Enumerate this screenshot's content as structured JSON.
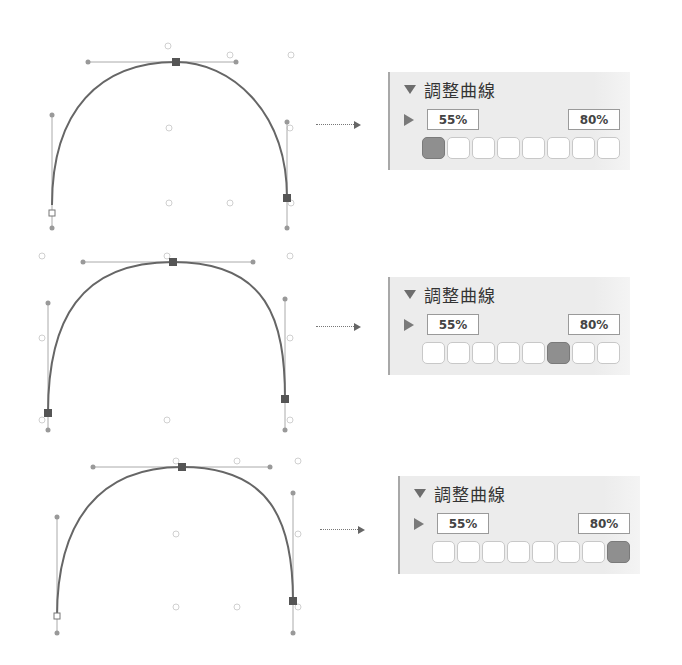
{
  "rows": [
    {
      "panel": {
        "title": "調整曲線",
        "min_value": "55%",
        "max_value": "80%",
        "selected_swatch": 0,
        "swatch_count": 8
      },
      "curve": {
        "path": "M52,205 C52,110 100,62 176,62 C230,62 287,110 287,198",
        "anchors": [
          [
            176,
            62
          ],
          [
            287,
            198
          ]
        ],
        "open_anchor": [
          52,
          213
        ],
        "handles": [
          [
            [
              88,
              62
            ],
            [
              236,
              62
            ]
          ],
          [
            [
              52,
              115
            ],
            [
              52,
              228
            ]
          ],
          [
            [
              287,
              122
            ],
            [
              287,
              228
            ]
          ]
        ],
        "guides": [
          [
            168,
            46
          ],
          [
            230,
            55
          ],
          [
            291,
            55
          ],
          [
            169,
            128
          ],
          [
            290,
            128
          ],
          [
            169,
            203
          ],
          [
            230,
            203
          ],
          [
            291,
            203
          ]
        ]
      }
    },
    {
      "panel": {
        "title": "調整曲線",
        "min_value": "55%",
        "max_value": "80%",
        "selected_swatch": 5,
        "swatch_count": 8
      },
      "curve": {
        "path": "M48,413 C48,320 80,262 173,262 C268,262 285,320 285,399",
        "anchors": [
          [
            173,
            262
          ],
          [
            285,
            399
          ],
          [
            48,
            413
          ]
        ],
        "open_anchor": null,
        "handles": [
          [
            [
              83,
              262
            ],
            [
              253,
              262
            ]
          ],
          [
            [
              48,
              303
            ],
            [
              48,
              430
            ]
          ],
          [
            [
              285,
              299
            ],
            [
              285,
              430
            ]
          ]
        ],
        "guides": [
          [
            42,
            256
          ],
          [
            167,
            256
          ],
          [
            290,
            256
          ],
          [
            42,
            338
          ],
          [
            290,
            338
          ],
          [
            42,
            420
          ],
          [
            167,
            420
          ],
          [
            290,
            420
          ]
        ]
      }
    },
    {
      "panel": {
        "title": "調整曲線",
        "min_value": "55%",
        "max_value": "80%",
        "selected_swatch": 7,
        "swatch_count": 8
      },
      "curve": {
        "path": "M57,617 C57,520 100,467 182,467 C270,467 293,520 293,601",
        "anchors": [
          [
            182,
            467
          ],
          [
            293,
            601
          ]
        ],
        "open_anchor": [
          57,
          616
        ],
        "handles": [
          [
            [
              93,
              467
            ],
            [
              270,
              467
            ]
          ],
          [
            [
              57,
              517
            ],
            [
              57,
              633
            ]
          ],
          [
            [
              293,
              493
            ],
            [
              293,
              633
            ]
          ]
        ],
        "guides": [
          [
            176,
            461
          ],
          [
            237,
            461
          ],
          [
            298,
            461
          ],
          [
            176,
            534
          ],
          [
            298,
            534
          ],
          [
            176,
            607
          ],
          [
            237,
            607
          ],
          [
            298,
            607
          ]
        ]
      }
    }
  ],
  "arrow_label": "",
  "colors": {
    "curve": "#666666",
    "handle_line": "#aaaaaa",
    "anchor": "#555555",
    "panel_bg": "#ececec",
    "swatch_selected": "#8f8f8f"
  }
}
